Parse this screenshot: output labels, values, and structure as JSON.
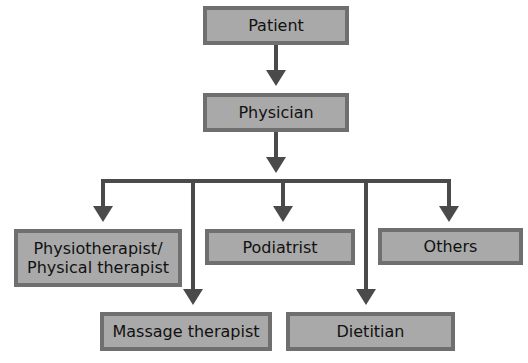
{
  "diagram": {
    "colors": {
      "box_fill": "#a9a9a9",
      "box_border": "#6f6f6f",
      "connector": "#4a4a4a",
      "text": "#111111"
    },
    "nodes": {
      "patient": {
        "label": "Patient"
      },
      "physician": {
        "label": "Physician"
      },
      "physiotherapist": {
        "label_line1": "Physiotherapist/",
        "label_line2": "Physical therapist"
      },
      "podiatrist": {
        "label": "Podiatrist"
      },
      "others": {
        "label": "Others"
      },
      "massage_therapist": {
        "label": "Massage therapist"
      },
      "dietitian": {
        "label": "Dietitian"
      }
    },
    "edges": [
      {
        "from": "Patient",
        "to": "Physician"
      },
      {
        "from": "Physician",
        "to": "Physiotherapist/Physical therapist"
      },
      {
        "from": "Physician",
        "to": "Massage therapist"
      },
      {
        "from": "Physician",
        "to": "Podiatrist"
      },
      {
        "from": "Physician",
        "to": "Dietitian"
      },
      {
        "from": "Physician",
        "to": "Others"
      }
    ]
  }
}
